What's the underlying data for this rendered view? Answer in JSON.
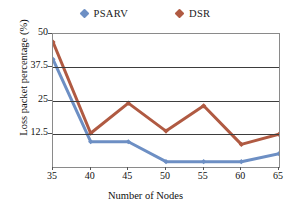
{
  "chart_data": {
    "type": "line",
    "title": "",
    "xlabel": "Number of Nodes",
    "ylabel": "Loss packet percentage (%)",
    "x": [
      35,
      40,
      45,
      50,
      55,
      60,
      65
    ],
    "xticklabels": [
      "35",
      "40",
      "45",
      "50",
      "55",
      "60",
      "65"
    ],
    "yticklabels": [
      "12.5",
      "25",
      "37.5",
      "50"
    ],
    "yticks": [
      12.5,
      25,
      37.5,
      50
    ],
    "xlim": [
      35,
      65
    ],
    "ylim": [
      0,
      50
    ],
    "grid": "horizontal",
    "legend_position": "top-center",
    "markers": "diamond",
    "series": [
      {
        "name": "PSARV",
        "color": "#6d8fc4",
        "values": [
          40.5,
          9.5,
          9.5,
          2.0,
          2.0,
          2.0,
          5.0
        ]
      },
      {
        "name": "DSR",
        "color": "#b05a42",
        "values": [
          47.0,
          12.7,
          24.0,
          13.5,
          23.0,
          8.5,
          12.3
        ]
      }
    ]
  }
}
